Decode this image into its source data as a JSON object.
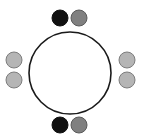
{
  "figure": {
    "type": "lewis-dot-structure",
    "width": 141,
    "height": 138,
    "background_color": "#ffffff",
    "title": "",
    "caption": ""
  },
  "chart_data": {
    "type": "scatter",
    "title": "",
    "xlabel": "",
    "ylabel": "",
    "xlim": [
      0,
      141
    ],
    "ylim": [
      0,
      138
    ],
    "grid": false,
    "legend": "none",
    "shell": {
      "name": "valence-shell-circle",
      "shape": "circle",
      "center_x": 70,
      "center_y": 73,
      "radius": 41,
      "fill_color": "#ffffff",
      "stroke_color": "#1a1a1a",
      "stroke_width": 1.6
    },
    "series": [
      {
        "name": "dark electrons",
        "fill_color": "#111111",
        "stroke_color": "#111111",
        "points": [
          {
            "label": "top-left-electron",
            "x": 60,
            "y": 18,
            "r": 8
          },
          {
            "label": "bottom-left-electron",
            "x": 60,
            "y": 125,
            "r": 8
          }
        ]
      },
      {
        "name": "medium gray electrons",
        "fill_color": "#808080",
        "stroke_color": "#5a5a5a",
        "points": [
          {
            "label": "top-right-electron",
            "x": 79,
            "y": 18,
            "r": 8
          },
          {
            "label": "bottom-right-electron",
            "x": 79,
            "y": 125,
            "r": 8
          }
        ]
      },
      {
        "name": "light gray electrons",
        "fill_color": "#b5b5b5",
        "stroke_color": "#7d7d7d",
        "points": [
          {
            "label": "left-upper-electron",
            "x": 14,
            "y": 60,
            "r": 8
          },
          {
            "label": "left-lower-electron",
            "x": 14,
            "y": 80,
            "r": 8
          },
          {
            "label": "right-upper-electron",
            "x": 127,
            "y": 60,
            "r": 8
          },
          {
            "label": "right-lower-electron",
            "x": 127,
            "y": 80,
            "r": 8
          }
        ]
      }
    ],
    "electron_pair_count": 4,
    "electron_total": 8
  }
}
